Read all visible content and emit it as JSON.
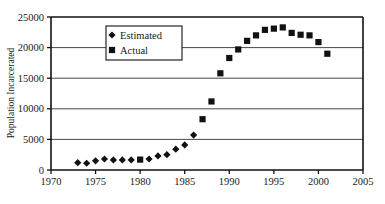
{
  "chart_data": {
    "type": "scatter",
    "title": "",
    "xlabel": "",
    "ylabel": "Population Incarcerated",
    "xlim": [
      1970,
      2005
    ],
    "ylim": [
      0,
      25000
    ],
    "grid": true,
    "legend_position": "top-left-inside",
    "x_ticks": [
      1970,
      1975,
      1980,
      1985,
      1990,
      1995,
      2000,
      2005
    ],
    "x_tick_labels": [
      "1970",
      "1975",
      "1980",
      "1985",
      "1990",
      "1995",
      "2000",
      "2005"
    ],
    "y_ticks": [
      0,
      5000,
      10000,
      15000,
      20000,
      25000
    ],
    "y_tick_labels": [
      "0",
      "5000",
      "10000",
      "15000",
      "20000",
      "25000"
    ],
    "series": [
      {
        "name": "Estimated",
        "marker": "diamond",
        "color": "#111111",
        "points": [
          {
            "x": 1973,
            "y": 1200
          },
          {
            "x": 1974,
            "y": 1100
          },
          {
            "x": 1975,
            "y": 1500
          },
          {
            "x": 1976,
            "y": 1800
          },
          {
            "x": 1977,
            "y": 1650
          },
          {
            "x": 1978,
            "y": 1650
          },
          {
            "x": 1979,
            "y": 1650
          },
          {
            "x": 1981,
            "y": 1800
          },
          {
            "x": 1982,
            "y": 2300
          },
          {
            "x": 1983,
            "y": 2500
          },
          {
            "x": 1984,
            "y": 3400
          },
          {
            "x": 1985,
            "y": 4100
          },
          {
            "x": 1986,
            "y": 5700
          }
        ]
      },
      {
        "name": "Actual",
        "marker": "square",
        "color": "#111111",
        "points": [
          {
            "x": 1980,
            "y": 1700
          },
          {
            "x": 1987,
            "y": 8300
          },
          {
            "x": 1988,
            "y": 11200
          },
          {
            "x": 1989,
            "y": 15800
          },
          {
            "x": 1990,
            "y": 18300
          },
          {
            "x": 1991,
            "y": 19700
          },
          {
            "x": 1992,
            "y": 21100
          },
          {
            "x": 1993,
            "y": 22000
          },
          {
            "x": 1994,
            "y": 22900
          },
          {
            "x": 1995,
            "y": 23100
          },
          {
            "x": 1996,
            "y": 23300
          },
          {
            "x": 1997,
            "y": 22400
          },
          {
            "x": 1998,
            "y": 22100
          },
          {
            "x": 1999,
            "y": 22000
          },
          {
            "x": 2000,
            "y": 20900
          },
          {
            "x": 2001,
            "y": 19000
          }
        ]
      }
    ],
    "legend": [
      {
        "label": "Estimated",
        "marker": "diamond",
        "color": "#111111"
      },
      {
        "label": "Actual",
        "marker": "square",
        "color": "#111111"
      }
    ]
  },
  "colors": {
    "background": "#ffffff",
    "axis": "#111111",
    "grid": "#333333",
    "marker": "#111111"
  }
}
